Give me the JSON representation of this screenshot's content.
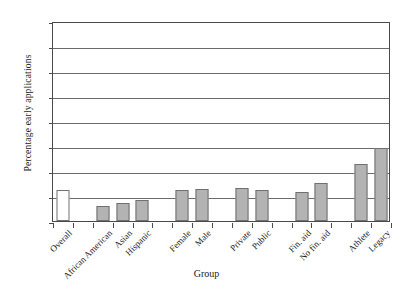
{
  "chart_data": {
    "type": "bar",
    "title": "",
    "xlabel": "Group",
    "ylabel": "Percentage early applications",
    "ylim": [
      0,
      40
    ],
    "yticks": [
      0,
      5,
      10,
      15,
      20,
      25,
      30,
      35,
      40
    ],
    "grid": true,
    "legend": "none",
    "categories": [
      "Overall",
      "African American",
      "Asian",
      "Hispanic",
      "Female",
      "Male",
      "Private",
      "Public",
      "Fin. aid",
      "No fin. aid",
      "Athlete",
      "Legacy"
    ],
    "values": [
      6.2,
      3.1,
      3.7,
      4.2,
      6.2,
      6.5,
      6.7,
      6.3,
      5.8,
      7.6,
      11.4,
      14.7
    ],
    "bar_styles": [
      "hollow",
      "filled",
      "filled",
      "filled",
      "filled",
      "filled",
      "filled",
      "filled",
      "filled",
      "filled",
      "filled",
      "filled"
    ],
    "slot_index": [
      0,
      2,
      3,
      4,
      6,
      7,
      9,
      10,
      12,
      13,
      15,
      16
    ],
    "total_slots": 17,
    "colors": {
      "bar_fill": "#b3b3b3",
      "bar_hollow_fill": "#ffffff",
      "bar_border": "#707070",
      "gridline": "#6b6b6b",
      "axis": "#4a4a4a",
      "background": "#ffffff",
      "text": "#1a1a1a"
    }
  }
}
